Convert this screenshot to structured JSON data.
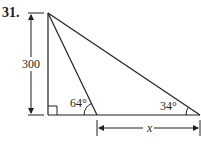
{
  "problem": {
    "number": "31."
  },
  "diagram": {
    "height_label": "300",
    "angle_near_label": "64°",
    "angle_far_label": "34°",
    "unknown_label": "x",
    "right_angle_marker": true,
    "stroke_color": "#231f20"
  }
}
